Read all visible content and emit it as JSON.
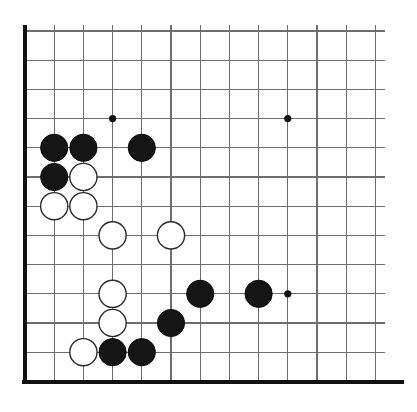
{
  "diagram": {
    "board_size": 19,
    "visible_columns": 13,
    "visible_rows": 13,
    "colors": {
      "background": "#ffffff",
      "grid_line": "#6e6e6e",
      "edge_line": "#111111",
      "black_stone": "#151515",
      "white_stone": "#ffffff",
      "white_stone_outline": "#2b2b2b",
      "star_point": "#111111"
    },
    "geometry": {
      "origin_x": 25,
      "origin_y": 31,
      "spacing": 29.2,
      "stone_radius": 13.6,
      "star_radius": 3.6
    },
    "edges": [
      {
        "name": "left-edge",
        "x1": 25,
        "y1": 25,
        "x2": 25,
        "y2": 382
      },
      {
        "name": "bottom-edge",
        "x1": 22,
        "y1": 382,
        "x2": 404,
        "y2": 382
      }
    ],
    "star_points": [
      {
        "col": 3,
        "row": 3
      },
      {
        "col": 9,
        "row": 3
      },
      {
        "col": 9,
        "row": 9
      }
    ],
    "stones": [
      {
        "color": "black",
        "col": 1,
        "row": 4
      },
      {
        "color": "black",
        "col": 2,
        "row": 4
      },
      {
        "color": "black",
        "col": 4,
        "row": 4
      },
      {
        "color": "black",
        "col": 1,
        "row": 5
      },
      {
        "color": "white",
        "col": 2,
        "row": 5
      },
      {
        "color": "white",
        "col": 1,
        "row": 6
      },
      {
        "color": "white",
        "col": 2,
        "row": 6
      },
      {
        "color": "white",
        "col": 3,
        "row": 7
      },
      {
        "color": "white",
        "col": 5,
        "row": 7
      },
      {
        "color": "white",
        "col": 3,
        "row": 9
      },
      {
        "color": "black",
        "col": 6,
        "row": 9
      },
      {
        "color": "black",
        "col": 8,
        "row": 9
      },
      {
        "color": "white",
        "col": 3,
        "row": 10
      },
      {
        "color": "black",
        "col": 5,
        "row": 10
      },
      {
        "color": "white",
        "col": 2,
        "row": 11
      },
      {
        "color": "black",
        "col": 3,
        "row": 11
      },
      {
        "color": "black",
        "col": 4,
        "row": 11
      }
    ]
  },
  "chart_data": {
    "type": "diagram",
    "xlabel": "",
    "ylabel": "",
    "categories": [
      "black",
      "white"
    ],
    "values": [
      9,
      8
    ]
  }
}
